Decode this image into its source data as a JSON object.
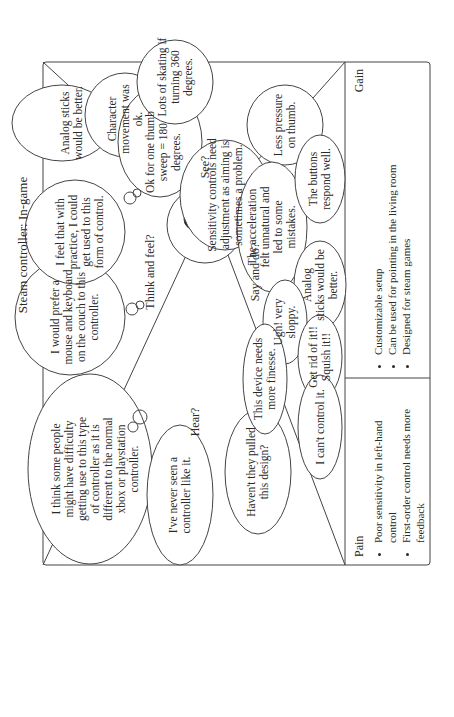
{
  "title": "Steam controller: In-game",
  "face": {
    "prompts": {
      "think_feel": "Think and feel?",
      "see": "See?",
      "hear": "Hear?",
      "say_do": "Say and do?"
    }
  },
  "think_feel": [
    "I think some people\nmight have difficulty\ngetting use to this type\nof controller as it is\ndifferent to the normal\nxbox or playstation\ncontroller.",
    "I would prefer a\nmouse and keyboard\non the couch to this\ncontroller.",
    "I feel that with\npractice, I could\nget used to this\nform of control.",
    "Analog sticks\nwould be better."
  ],
  "see": [
    "Character\nmovement was\nok.",
    "Ok for one thumb\nsweep = 180\ndegrees.",
    "Lots of skating if\nturning 360\ndegrees.",
    "Sensitivity controls need\nadjustment as aiming is\nsometimes a problem.",
    "Less pressure\non thumb."
  ],
  "hear": [
    "I've never seen a\ncontroller like it.",
    "Haven't they pulled\nthis design?"
  ],
  "say_do": [
    "The acceleration\nfelt unnatural and\nled to some\nmistakes.",
    "The buttons\nrespond well.",
    "Analog\nsticks would be\nbetter.",
    "Ugh! very\nsloppy.",
    "Get rid of it!!\nSquish it!!",
    "I can't control it.",
    "This device needs\nmore finesse."
  ],
  "pain": {
    "label": "Pain",
    "items": [
      "Poor sensitivity in left-hand control",
      "First-order control needs more\nfeedback"
    ]
  },
  "gain": {
    "label": "Gain",
    "items": [
      "Customizable setup",
      "Can be used for pointing in the living room",
      "Designed for steam games"
    ]
  }
}
